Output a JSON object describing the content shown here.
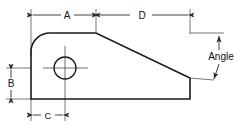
{
  "drawing": {
    "title": "Bracket profile dimensioned drawing",
    "background_color": "#ffffff",
    "line_color": "#1a1a1a",
    "thin_line_color": "#555555",
    "dimensions": [
      {
        "id": "A",
        "label": "A",
        "orientation": "horizontal",
        "position": "top-left",
        "description": "Horizontal distance from left face to start of angled edge"
      },
      {
        "id": "D",
        "label": "D",
        "orientation": "horizontal",
        "position": "top-right",
        "description": "Horizontal length of the angled edge span"
      },
      {
        "id": "B",
        "label": "B",
        "orientation": "vertical",
        "position": "left",
        "description": "Height from bottom face to hole centre"
      },
      {
        "id": "C",
        "label": "C",
        "orientation": "horizontal",
        "position": "bottom",
        "description": "Horizontal distance from left face to hole centre"
      },
      {
        "id": "Angle",
        "label": "Angle",
        "orientation": "vertical",
        "position": "right",
        "description": "Angle of the sloped edge"
      }
    ],
    "features": {
      "hole": {
        "name": "through-hole",
        "shape": "circle"
      },
      "fillet": {
        "name": "rounded-corner",
        "shape": "arc"
      },
      "slope": {
        "name": "angled-edge",
        "shape": "line"
      }
    }
  }
}
